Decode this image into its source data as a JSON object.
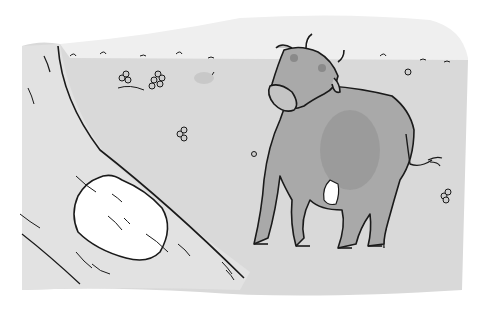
{
  "image": {
    "description": "Ink and grey watercolor illustration of a cow standing in a field, looking back over its shoulder, beside a curving path with a white rock",
    "style": "grayscale watercolor with black ink outlines"
  },
  "colors": {
    "background": "#ffffff",
    "field": "#d9d9d9",
    "sky": "#efefef",
    "cow_body": "#a9a9a9",
    "cow_shadow": "#8f8f8f",
    "ink": "#1a1a1a",
    "rock": "#ffffff",
    "udder": "#ffffff"
  },
  "elements": {
    "cow": "cow standing, head turned toward viewer, tail curled at right",
    "path": "curving path along the left side",
    "rock": "white rounded rock on the path",
    "flowers": "small clover-like flowers scattered in field"
  }
}
